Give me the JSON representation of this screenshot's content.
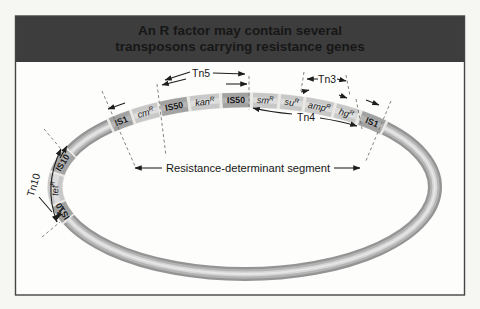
{
  "title": {
    "line1": "An R factor may contain several",
    "line2": "transposons carrying resistance genes"
  },
  "annotations": {
    "tn5": "Tn5",
    "tn3": "Tn3",
    "tn4": "Tn4",
    "tn10": "Tn10",
    "resistance_segment": "Resistance-determinant segment"
  },
  "plasmid": {
    "description": "circular R factor plasmid",
    "bands": [
      {
        "a0": 135.5,
        "a1": 42.5
      },
      {
        "a0": 202.0,
        "a1": 156.0
      }
    ],
    "segments": [
      {
        "name": "is10-lower",
        "label": "IS10",
        "sup": "",
        "type": "is",
        "a0": 201.0,
        "a1": 191.5
      },
      {
        "name": "tet-r",
        "label": "tet",
        "sup": "R",
        "type": "gene",
        "a0": 190.0,
        "a1": 172.0
      },
      {
        "name": "is10-upper",
        "label": "IS10",
        "sup": "",
        "type": "is",
        "a0": 170.5,
        "a1": 157.0
      },
      {
        "name": "is1-left",
        "label": "IS1",
        "sup": "",
        "type": "is",
        "a0": 134.5,
        "a1": 126.8
      },
      {
        "name": "cm-r",
        "label": "cm",
        "sup": "R",
        "type": "gene",
        "a0": 125.8,
        "a1": 117.2
      },
      {
        "name": "is50-left",
        "label": "IS50",
        "sup": "",
        "type": "is",
        "a0": 116.2,
        "a1": 107.6
      },
      {
        "name": "kan-r",
        "label": "kan",
        "sup": "R",
        "type": "gene",
        "a0": 106.6,
        "a1": 97.8
      },
      {
        "name": "is50-right",
        "label": "IS50",
        "sup": "",
        "type": "is",
        "a0": 96.8,
        "a1": 88.6
      },
      {
        "name": "sm-r",
        "label": "sm",
        "sup": "R",
        "type": "gene",
        "a0": 87.6,
        "a1": 80.2
      },
      {
        "name": "su-r",
        "label": "su",
        "sup": "R",
        "type": "gene",
        "a0": 79.2,
        "a1": 72.4
      },
      {
        "name": "amp-r",
        "label": "amp",
        "sup": "R",
        "type": "gene",
        "a0": 71.4,
        "a1": 62.6
      },
      {
        "name": "hg-r",
        "label": "hg",
        "sup": "R",
        "type": "gene",
        "a0": 61.6,
        "a1": 54.0
      },
      {
        "name": "is1-right",
        "label": "IS1",
        "sup": "",
        "type": "is",
        "a0": 52.6,
        "a1": 43.5
      }
    ]
  },
  "colors": {
    "title_bar": "#3d3d3d",
    "title_text": "#f7f6f2",
    "figure_bg": "#fdfdfb",
    "frame_border": "#454545",
    "tube_base": "#949494",
    "tube_mid": "#b4b4b4",
    "tube_light": "#d6d6d6",
    "tube_core": "#e6e6e6",
    "band_separator": "#eae9e5",
    "is_fill": "#a2a2a2",
    "is_light": "#b5b5b5",
    "gene_fill": "#c8c8c8",
    "gene_light": "#dddddd",
    "label_ink": "#171717"
  }
}
